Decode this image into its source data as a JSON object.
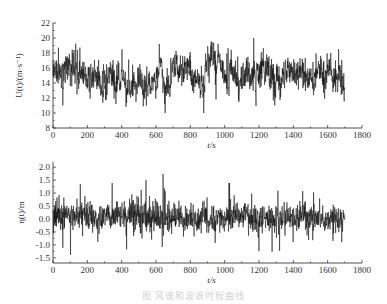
{
  "figure": {
    "caption": "图 风速和波浪时程曲线"
  },
  "chart_data": [
    {
      "type": "line",
      "title": "",
      "xlabel": "t/s",
      "ylabel": "U(t)/(m·s⁻¹)",
      "xlim": [
        0,
        1800
      ],
      "ylim": [
        8,
        22
      ],
      "xticks": [
        0,
        200,
        400,
        600,
        800,
        1000,
        1200,
        1400,
        1600,
        1800
      ],
      "yticks": [
        8,
        10,
        12,
        14,
        16,
        18,
        20,
        22
      ],
      "grid": false,
      "legend": null,
      "series": [
        {
          "name": "U(t)",
          "t_start": 0,
          "t_end": 1700,
          "mean": 15,
          "std": 1.6,
          "min": 10,
          "max": 20,
          "color": "#111111"
        }
      ]
    },
    {
      "type": "line",
      "title": "",
      "xlabel": "t/s",
      "ylabel": "η(t)/m",
      "xlim": [
        0,
        1800
      ],
      "ylim": [
        -1.7,
        2.2
      ],
      "xticks": [
        0,
        200,
        400,
        600,
        800,
        1000,
        1200,
        1400,
        1600,
        1800
      ],
      "yticks": [
        -1.5,
        -1.0,
        -0.5,
        0.0,
        0.5,
        1.0,
        1.5,
        2.0
      ],
      "ytick_labels": [
        "-1.5",
        "-1.0",
        "-0.5",
        "0.0",
        "0.5",
        "1.0",
        "1.5",
        "2.0"
      ],
      "grid": false,
      "legend": null,
      "series": [
        {
          "name": "η(t)",
          "t_start": 0,
          "t_end": 1700,
          "mean": 0.05,
          "std": 0.35,
          "min": -1.45,
          "max": 1.9,
          "color": "#111111"
        }
      ]
    }
  ]
}
